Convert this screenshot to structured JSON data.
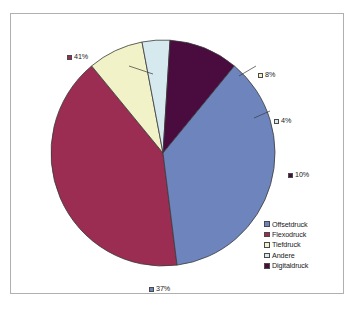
{
  "chart_data": {
    "type": "pie",
    "title": "",
    "categories": [
      "Offsetdruck",
      "Flexodruck",
      "Tiefdruck",
      "Andere",
      "Digitaldruck"
    ],
    "values": [
      37,
      41,
      8,
      4,
      10
    ],
    "value_labels": [
      "37%",
      "41%",
      "8%",
      "4%",
      "10%"
    ],
    "unit": "%",
    "colors": [
      "#6D85BC",
      "#9B2D52",
      "#F2F2C8",
      "#D6E9EF",
      "#4A0B3F"
    ],
    "legend_position": "bottom-right",
    "grid": false,
    "slices": [
      {
        "label": "Flexodruck",
        "value": 41,
        "value_label": "41%",
        "color": "#9B2D52",
        "swatch_border": "#4a4a4a",
        "start_angle": 172.8,
        "end_angle": 320.4
      },
      {
        "label": "Tiefdruck",
        "value": 8,
        "value_label": "8%",
        "color": "#F2F2C8",
        "swatch_border": "#4a4a4a",
        "start_angle": 320.4,
        "end_angle": 349.2
      },
      {
        "label": "Andere",
        "value": 4,
        "value_label": "4%",
        "color": "#D6E9EF",
        "swatch_border": "#4a4a4a",
        "start_angle": 349.2,
        "end_angle": 363.6
      },
      {
        "label": "Digitaldruck",
        "value": 10,
        "value_label": "10%",
        "color": "#4A0B3F",
        "swatch_border": "#4a4a4a",
        "start_angle": 363.6,
        "end_angle": 399.6
      },
      {
        "label": "Offsetdruck",
        "value": 37,
        "value_label": "37%",
        "color": "#6D85BC",
        "swatch_border": "#4a4a4a",
        "start_angle": 399.6,
        "end_angle": 532.8
      }
    ]
  },
  "labels": {
    "flexodruck": "41%",
    "tiefdruck": "8%",
    "andere": "4%",
    "digitaldruck": "10%",
    "offsetdruck": "37%"
  },
  "legend": {
    "items": [
      {
        "label": "Offsetdruck",
        "color": "#6D85BC"
      },
      {
        "label": "Flexodruck",
        "color": "#9B2D52"
      },
      {
        "label": "Tiefdruck",
        "color": "#F2F2C8"
      },
      {
        "label": "Andere",
        "color": "#D6E9EF"
      },
      {
        "label": "Digitaldruck",
        "color": "#4A0B3F"
      }
    ]
  },
  "style": {
    "frame_border": "#b0b0b0",
    "slice_outline": "#3a3a3a",
    "background": "#ffffff"
  }
}
